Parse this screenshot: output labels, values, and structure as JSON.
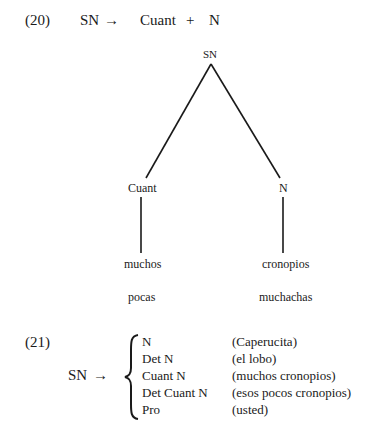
{
  "example20": {
    "number": "(20)",
    "rule": {
      "lhs": "SN",
      "arrow": "→",
      "rhs": [
        "Cuant",
        "+",
        "N"
      ]
    },
    "tree": {
      "root": "SN",
      "children": [
        {
          "label": "Cuant",
          "leaf": "muchos",
          "alt": "pocas"
        },
        {
          "label": "N",
          "leaf": "cronopios",
          "alt": "muchachas"
        }
      ]
    }
  },
  "example21": {
    "number": "(21)",
    "lhs": "SN",
    "arrow": "→",
    "expansions": [
      {
        "rule": "N",
        "example": "(Caperucita)"
      },
      {
        "rule": "Det N",
        "example": "(el lobo)"
      },
      {
        "rule": "Cuant N",
        "example": "(muchos cronopios)"
      },
      {
        "rule": "Det Cuant N",
        "example": "(esos pocos cronopios)"
      },
      {
        "rule": "Pro",
        "example": "(usted)"
      }
    ]
  }
}
